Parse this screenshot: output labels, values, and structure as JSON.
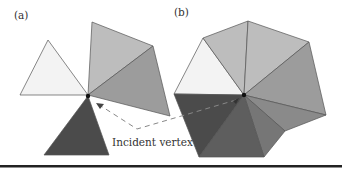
{
  "figure": {
    "panels": [
      {
        "id": "a",
        "label": "(a)",
        "description": "Separate triangles sharing a single vertex"
      },
      {
        "id": "b",
        "label": "(b)",
        "description": "Triangle fan around the shared vertex"
      }
    ],
    "annotation": {
      "text": "Incident vertex",
      "arrow_style": "dashed"
    },
    "colors": {
      "white_tri": "#f3f3f3",
      "light_tri": "#bdbdbd",
      "medium_tri": "#9c9c9c",
      "dark_tri": "#4b4b4b",
      "fan_dark2": "#5e5e5e",
      "fan_mid1": "#767676",
      "fan_mid2": "#8a8a8a",
      "vertex": "#111111",
      "rule": "#222222"
    }
  }
}
